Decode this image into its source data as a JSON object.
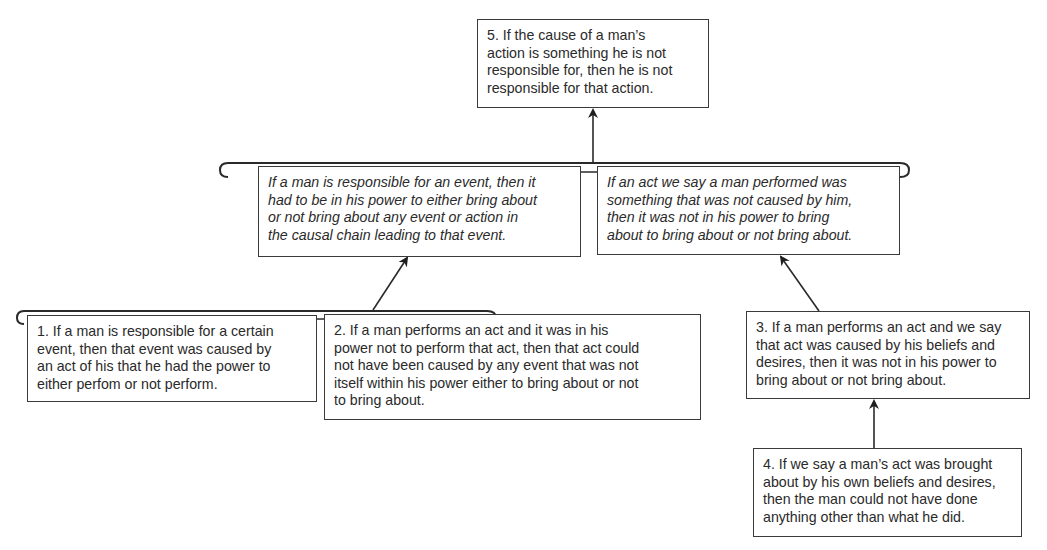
{
  "diagram": {
    "type": "argument-map",
    "nodes": [
      {
        "id": "5",
        "role": "conclusion",
        "style": "regular",
        "lines": [
          "5. If the cause of a man’s",
          "action is something he is not",
          "responsible for, then he is not",
          "responsible for that action."
        ]
      },
      {
        "id": "A",
        "role": "intermediate-premise-left",
        "style": "italic",
        "lines": [
          "If a man is responsible for an event, then it",
          "had to be in his power to either bring about",
          "or not bring about any event or action in",
          "the causal chain leading to that event."
        ]
      },
      {
        "id": "B",
        "role": "intermediate-premise-right",
        "style": "italic",
        "lines": [
          "If an act we say a man performed was",
          "something that was not caused by him,",
          "then it was not in his power to bring",
          "about to bring about or not bring about."
        ]
      },
      {
        "id": "1",
        "role": "premise",
        "style": "regular",
        "lines": [
          "1. If a man is responsible for a certain",
          "event, then that event was caused by",
          "an act of his that he had the power to",
          "either perfom or not perform."
        ]
      },
      {
        "id": "2",
        "role": "premise",
        "style": "regular",
        "lines": [
          "2. If a man performs an act and it was in his",
          "power not to perform that act, then that act could",
          "not have been caused by any event that was not",
          "itself within his power either to bring about or not",
          "to bring about."
        ]
      },
      {
        "id": "3",
        "role": "premise",
        "style": "regular",
        "lines": [
          "3. If a man performs an act and we say",
          "that act was caused by his beliefs and",
          "desires, then it was not in his power to",
          "bring about or not bring about."
        ]
      },
      {
        "id": "4",
        "role": "premise",
        "style": "regular",
        "lines": [
          "4. If we say a man’s act was brought",
          "about by his own beliefs and desires,",
          "then the man could not have done",
          "anything other than what he did."
        ]
      }
    ],
    "edges": [
      {
        "from": "bracket(A,B)",
        "to": "5"
      },
      {
        "from": "bracket(1,2)",
        "to": "A"
      },
      {
        "from": "3",
        "to": "B"
      },
      {
        "from": "4",
        "to": "3"
      }
    ],
    "colors": {
      "line": "#2a2a2a",
      "text": "#2a2a2a",
      "background": "#ffffff"
    }
  }
}
